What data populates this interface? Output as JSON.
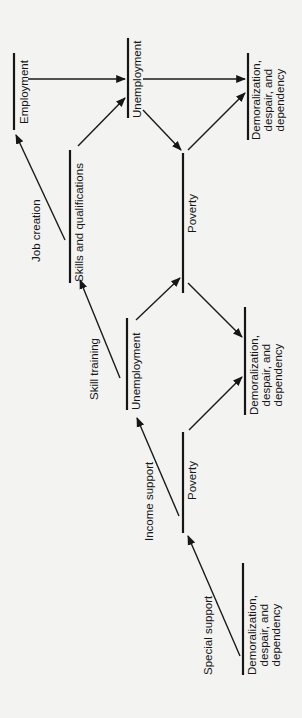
{
  "diagram": {
    "orientation": "rotated -90deg (read bottom-to-top)",
    "nodes": {
      "employment": "Employment",
      "unemployment_top": "Unemployment",
      "demoralization_top": "Demoralization,\ndespair, and\ndependency",
      "skills": "Skills and qualifications",
      "poverty_top": "Poverty",
      "unemployment_mid": "Unemployment",
      "demoralization_mid": "Demoralization,\ndespair, and\ndependency",
      "poverty_bottom": "Poverty",
      "demoralization_bottom": "Demoralization,\ndespair, and\ndependency"
    },
    "edge_labels": {
      "job_creation": "Job creation",
      "skill_training": "Skill training",
      "income_support": "Income support",
      "special_support": "Special support"
    },
    "edges": [
      {
        "from": "Employment",
        "to": "Unemployment (top)"
      },
      {
        "from": "Skills and qualifications",
        "to": "Unemployment (top)"
      },
      {
        "from": "Skills and qualifications",
        "to": "Employment",
        "label": "Job creation"
      },
      {
        "from": "Unemployment (top)",
        "to": "Demoralization (top)"
      },
      {
        "from": "Unemployment (top)",
        "to": "Poverty (top)"
      },
      {
        "from": "Poverty (top)",
        "to": "Demoralization (top)"
      },
      {
        "from": "Unemployment (mid)",
        "to": "Skills and qualifications",
        "label": "Skill training"
      },
      {
        "from": "Unemployment (mid)",
        "to": "Poverty (top)"
      },
      {
        "from": "Poverty (top)",
        "to": "Demoralization (mid)"
      },
      {
        "from": "Poverty (bottom)",
        "to": "Demoralization (mid)"
      },
      {
        "from": "Poverty (bottom)",
        "to": "Unemployment (mid)",
        "label": "Income support"
      },
      {
        "from": "Demoralization (bottom)",
        "to": "Poverty (bottom)",
        "label": "Special support"
      }
    ]
  }
}
